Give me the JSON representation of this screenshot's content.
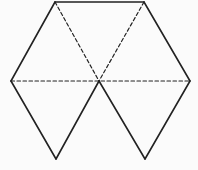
{
  "figure": {
    "stroke_color": "#222222",
    "background": "#fbfbfb",
    "points": {
      "top_left": [
        55,
        2
      ],
      "top_right": [
        144,
        2
      ],
      "left": [
        11,
        81
      ],
      "center": [
        99,
        81
      ],
      "right": [
        190,
        81
      ],
      "bottom_left": [
        56,
        159
      ],
      "bottom_right": [
        145,
        159
      ]
    },
    "solid_edges": [
      [
        "top_left",
        "top_right"
      ],
      [
        "top_left",
        "left"
      ],
      [
        "top_right",
        "right"
      ],
      [
        "left",
        "bottom_left"
      ],
      [
        "bottom_left",
        "center"
      ],
      [
        "center",
        "bottom_right"
      ],
      [
        "bottom_right",
        "right"
      ]
    ],
    "dashed_edges": [
      [
        "top_left",
        "center"
      ],
      [
        "top_right",
        "center"
      ],
      [
        "left",
        "right"
      ]
    ]
  }
}
